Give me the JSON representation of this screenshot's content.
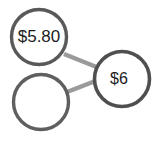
{
  "diagram": {
    "type": "number-bond",
    "background_color": "#ffffff",
    "node_stroke_color": "#595959",
    "node_fill_color": "#ffffff",
    "node_stroke_width": 3,
    "connector_color": "#9a9a9a",
    "connector_width": 4,
    "text_color": "#1c1c1c",
    "nodes": [
      {
        "id": "part-top",
        "label": "$5.80",
        "cx": 39,
        "cy": 37,
        "r": 28,
        "empty": false
      },
      {
        "id": "part-bottom",
        "label": "",
        "cx": 41,
        "cy": 102,
        "r": 28,
        "empty": true
      },
      {
        "id": "whole",
        "label": "$6",
        "cx": 122,
        "cy": 79,
        "r": 28,
        "empty": false
      }
    ],
    "connectors": [
      {
        "id": "connector-top",
        "from": "part-top",
        "to": "whole",
        "x1": 64,
        "y1": 54,
        "x2": 98,
        "y2": 68
      },
      {
        "id": "connector-bottom",
        "from": "part-bottom",
        "to": "whole",
        "x1": 67,
        "y1": 91,
        "x2": 97,
        "y2": 79
      }
    ]
  }
}
